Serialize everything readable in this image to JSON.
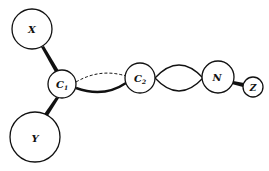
{
  "diagram": {
    "colors": {
      "stroke": "#111111",
      "background": "#ffffff"
    },
    "atoms": [
      {
        "id": "X",
        "label": "X",
        "cx": 32,
        "cy": 29,
        "r": 20,
        "font": 10
      },
      {
        "id": "C1",
        "label": "C",
        "sub": "1",
        "cx": 62,
        "cy": 84,
        "r": 14,
        "font": 10
      },
      {
        "id": "Y",
        "label": "Y",
        "cx": 35,
        "cy": 137,
        "r": 25,
        "font": 10
      },
      {
        "id": "C2",
        "label": "C",
        "sub": "2",
        "cx": 140,
        "cy": 78,
        "r": 15,
        "font": 10
      },
      {
        "id": "N",
        "label": "N",
        "cx": 218,
        "cy": 77,
        "r": 16,
        "font": 10
      },
      {
        "id": "Z",
        "label": "Z",
        "cx": 253,
        "cy": 87,
        "r": 10,
        "font": 9
      }
    ],
    "bonds": [
      {
        "from": "X",
        "to": "C1",
        "type": "wedge"
      },
      {
        "from": "C1",
        "to": "Y",
        "type": "wedge"
      },
      {
        "from": "C1",
        "to": "C2",
        "type": "sigma-solid-bold"
      },
      {
        "from": "C1",
        "to": "C2",
        "type": "pi-dashed"
      },
      {
        "from": "C2",
        "to": "N",
        "type": "double-lobe"
      },
      {
        "from": "N",
        "to": "Z",
        "type": "wedge"
      }
    ]
  }
}
